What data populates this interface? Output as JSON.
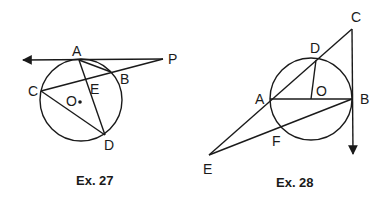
{
  "figures": [
    {
      "id": "ex27",
      "caption": "Ex. 27",
      "circle": {
        "center_label": "O",
        "cx": 81,
        "cy": 100,
        "r": 41
      },
      "points": {
        "A": {
          "label": "A",
          "x": 79,
          "y": 60
        },
        "B": {
          "label": "B",
          "x": 111,
          "y": 72
        },
        "C": {
          "label": "C",
          "x": 41,
          "y": 91
        },
        "D": {
          "label": "D",
          "x": 105,
          "y": 135
        },
        "E": {
          "label": "E",
          "x": 87,
          "y": 80
        },
        "O": {
          "label": "O",
          "x": 80,
          "y": 102
        },
        "P": {
          "label": "P",
          "x": 163,
          "y": 59
        }
      },
      "segments": [
        "tangent line through A ending at P (arrow left)",
        "AB",
        "PC",
        "AD",
        "CD"
      ]
    },
    {
      "id": "ex28",
      "caption": "Ex. 28",
      "circle": {
        "center_label": "O",
        "cx": 311,
        "cy": 99,
        "r": 41
      },
      "points": {
        "A": {
          "label": "A",
          "x": 270,
          "y": 99
        },
        "B": {
          "label": "B",
          "x": 352,
          "y": 99
        },
        "C": {
          "label": "C",
          "x": 352,
          "y": 29
        },
        "D": {
          "label": "D",
          "x": 316,
          "y": 60
        },
        "E": {
          "label": "E",
          "x": 209,
          "y": 155
        },
        "F": {
          "label": "F",
          "x": 280,
          "y": 127
        },
        "O": {
          "label": "O",
          "x": 311,
          "y": 99
        }
      },
      "segments": [
        "EC through A and D",
        "AB diameter",
        "OD radius",
        "EB through F",
        "tangent at B from C (arrow down)"
      ]
    }
  ]
}
